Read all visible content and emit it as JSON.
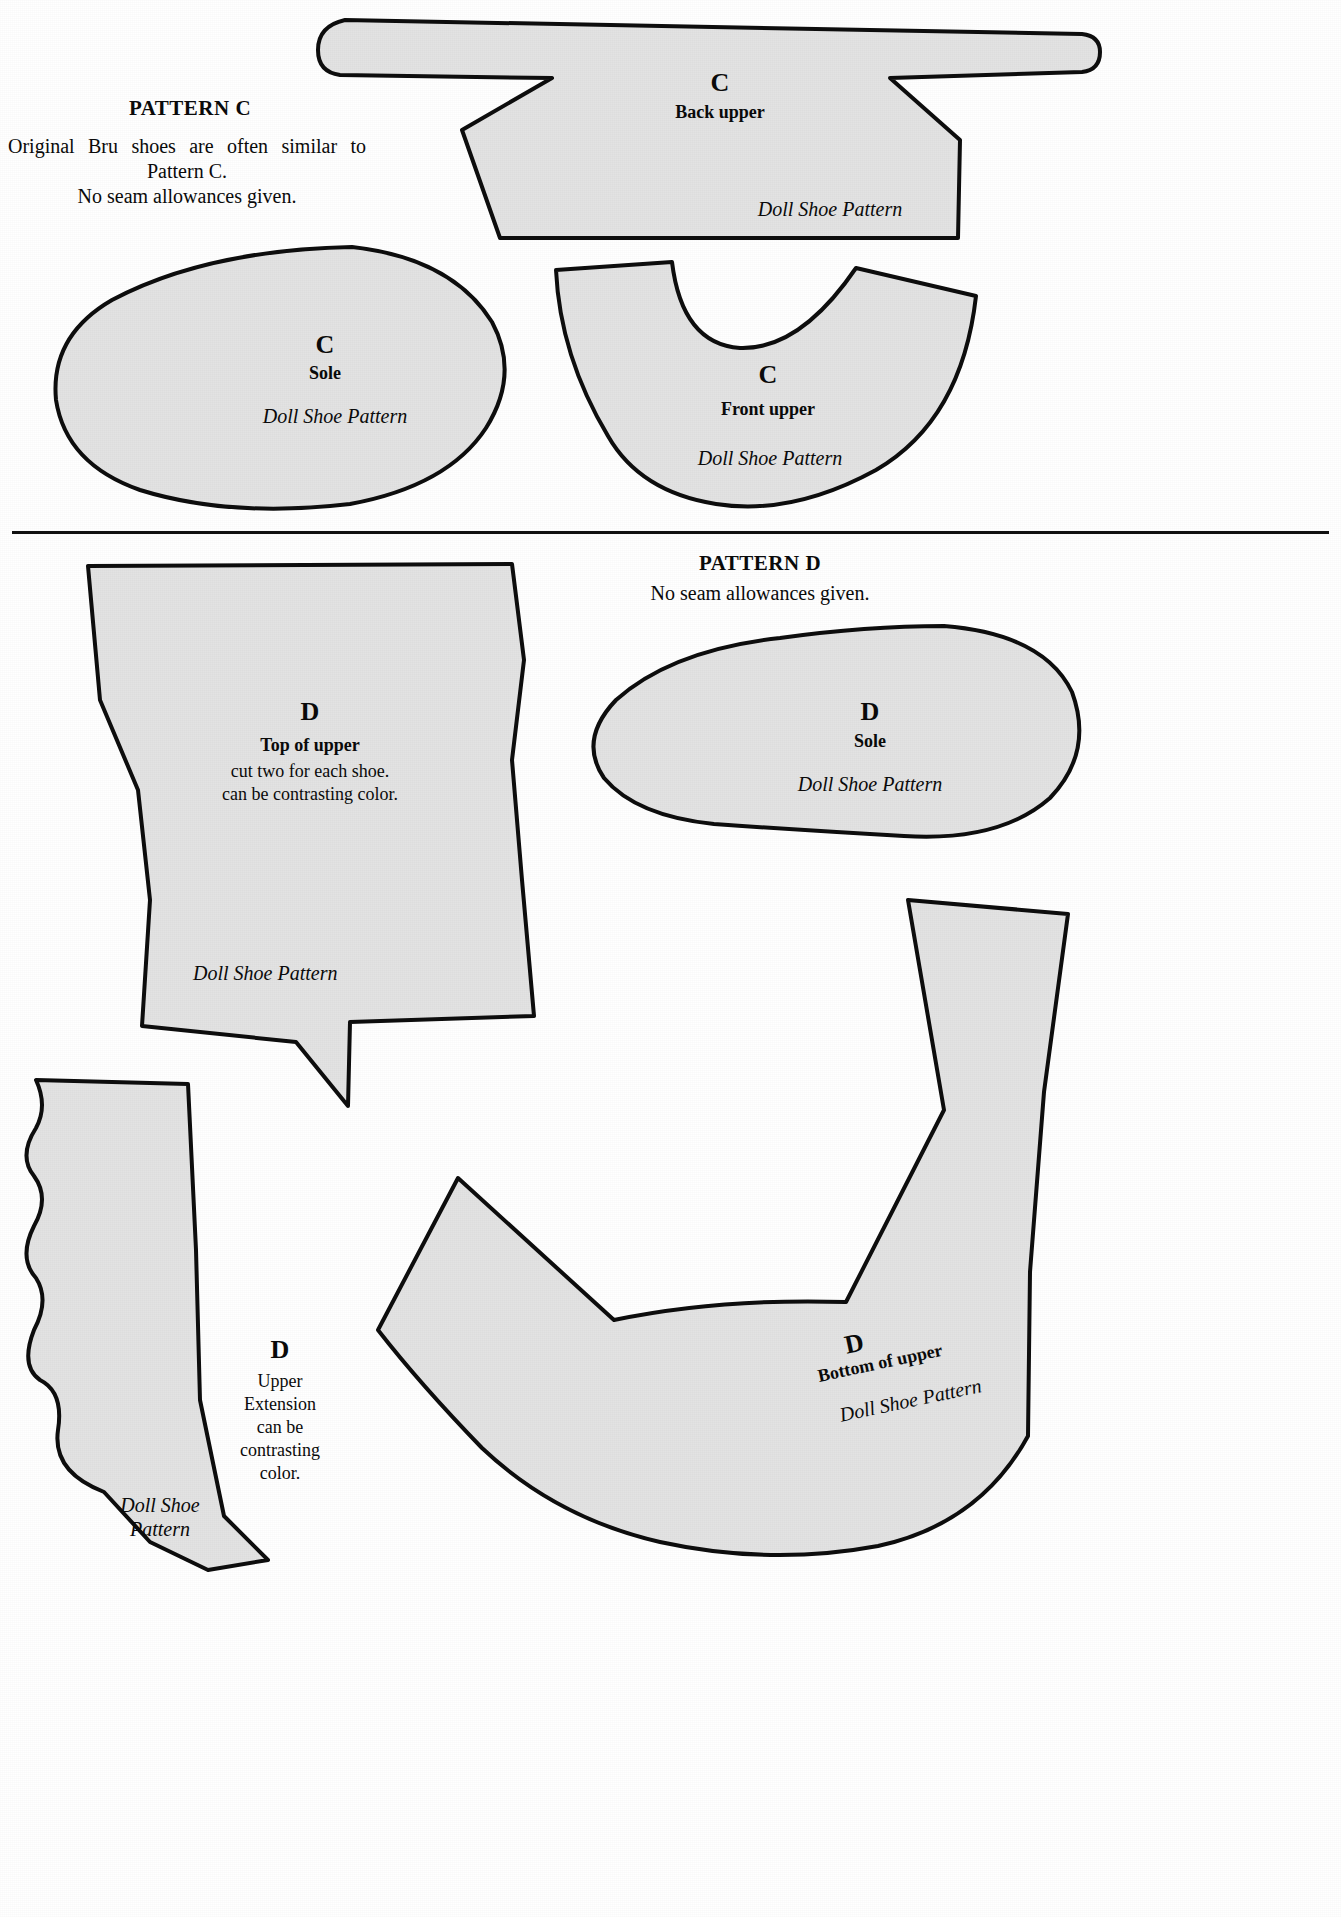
{
  "sheet": {
    "title": "Doll Shoe Pattern Sheet",
    "brand_mark": "Doll Shoe Pattern"
  },
  "pattern_c": {
    "heading": "PATTERN C",
    "note_line_1": "Original Bru shoes are often similar to",
    "note_line_2": "Pattern C.",
    "note_line_3": "No seam allowances given.",
    "pieces": {
      "back_upper": {
        "letter": "C",
        "name": "Back upper",
        "brand": "Doll Shoe Pattern"
      },
      "sole": {
        "letter": "C",
        "name": "Sole",
        "brand": "Doll Shoe Pattern"
      },
      "front_upper": {
        "letter": "C",
        "name": "Front upper",
        "brand": "Doll Shoe Pattern"
      }
    }
  },
  "pattern_d": {
    "heading": "PATTERN D",
    "note_line_1": "No seam allowances given.",
    "pieces": {
      "top_of_upper": {
        "letter": "D",
        "name": "Top of upper",
        "note_line_1": "cut two for each shoe.",
        "note_line_2": "can be contrasting color.",
        "brand": "Doll Shoe Pattern"
      },
      "sole": {
        "letter": "D",
        "name": "Sole",
        "brand": "Doll Shoe Pattern"
      },
      "bottom_of_upper": {
        "letter": "D",
        "name": "Bottom of upper",
        "brand": "Doll Shoe Pattern"
      },
      "upper_extension": {
        "letter": "D",
        "note_line_1": "Upper",
        "note_line_2": "Extension",
        "note_line_3": "can be",
        "note_line_4": "contrasting",
        "note_line_5": "color.",
        "brand_line_1": "Doll Shoe",
        "brand_line_2": "Pattern"
      }
    }
  },
  "colors": {
    "piece_fill": "#e3e3e3",
    "outline": "#0d0d0d",
    "paper": "#ffffff",
    "ink": "#0a0a0a"
  }
}
